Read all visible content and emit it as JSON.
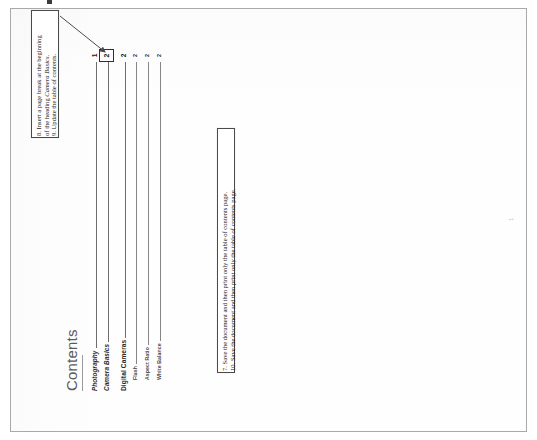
{
  "document": {
    "toc_title": "Contents",
    "page_footer_number": "1",
    "entries": [
      {
        "label": "Photography",
        "page": "1",
        "level": 1,
        "highlighted": false
      },
      {
        "label": "Camera Basics",
        "page": "2",
        "level": 1,
        "highlighted": true
      },
      {
        "label": "Digital Cameras",
        "page": "2",
        "level": "1b",
        "highlighted": false
      },
      {
        "label": "Flash",
        "page": "2",
        "level": 2,
        "highlighted": false
      },
      {
        "label": "Aspect Ratio",
        "page": "2",
        "level": 2,
        "highlighted": false
      },
      {
        "label": "White Balance",
        "page": "2",
        "level": 2,
        "highlighted": false
      }
    ]
  },
  "annotations": {
    "callout_1": {
      "line_1_prefix": "8. Insert a page break at the beginning",
      "line_2_prefix": "of the heading ",
      "line_2_italic": "Camera Basics",
      "line_2_suffix": ".",
      "line_3": "9. Update the table of contents."
    },
    "callout_2": {
      "line_1": "7. Save the document and then print only the table of contents page.",
      "line_2": "10. Save the document and then print only the table of contents page."
    }
  },
  "colors": {
    "page_border": "#a9a9a9",
    "callout_border": "#4a4a4a",
    "arrow": "#4a4a4a",
    "toc_title_text": "#5b5b5b",
    "leader_line": "#6d6d6d"
  }
}
